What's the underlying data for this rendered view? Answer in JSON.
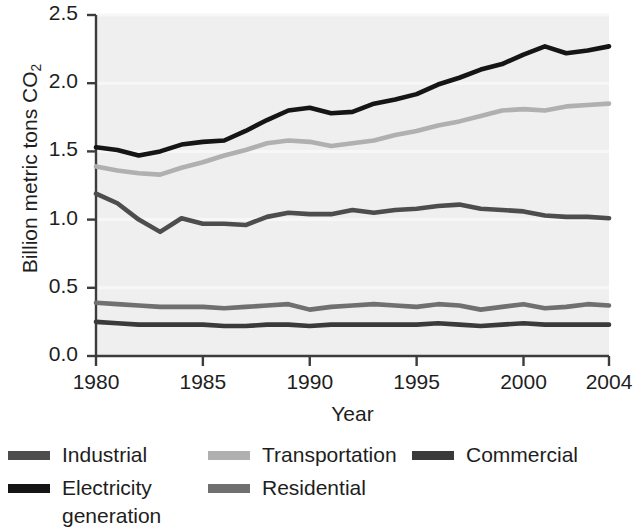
{
  "chart_data": {
    "type": "line",
    "title": "",
    "xlabel": "Year",
    "ylabel": "Billion metric tons CO2",
    "ylabel_base": "Billion metric tons CO",
    "ylabel_sub": "2",
    "xlim": [
      1980,
      2004
    ],
    "ylim": [
      0.0,
      2.5
    ],
    "grid": false,
    "legend_position": "below",
    "x": [
      1980,
      1981,
      1982,
      1983,
      1984,
      1985,
      1986,
      1987,
      1988,
      1989,
      1990,
      1991,
      1992,
      1993,
      1994,
      1995,
      1996,
      1997,
      1998,
      1999,
      2000,
      2001,
      2002,
      2003,
      2004
    ],
    "xticks": [
      1980,
      1985,
      1990,
      1995,
      2000,
      2004
    ],
    "xtick_labels": [
      "1980",
      "1985",
      "1990",
      "1995",
      "2000",
      "2004"
    ],
    "yticks": [
      0.0,
      0.5,
      1.0,
      1.5,
      2.0,
      2.5
    ],
    "ytick_labels": [
      "0.0",
      "0.5",
      "1.0",
      "1.5",
      "2.0",
      "2.5"
    ],
    "series": [
      {
        "name": "Electricity generation",
        "color": "#151515",
        "values": [
          1.53,
          1.51,
          1.47,
          1.5,
          1.55,
          1.57,
          1.58,
          1.65,
          1.73,
          1.8,
          1.82,
          1.78,
          1.79,
          1.85,
          1.88,
          1.92,
          1.99,
          2.04,
          2.1,
          2.14,
          2.21,
          2.27,
          2.22,
          2.24,
          2.27
        ]
      },
      {
        "name": "Transportation",
        "color": "#b0b0b0",
        "values": [
          1.39,
          1.36,
          1.34,
          1.33,
          1.38,
          1.42,
          1.47,
          1.51,
          1.56,
          1.58,
          1.57,
          1.54,
          1.56,
          1.58,
          1.62,
          1.65,
          1.69,
          1.72,
          1.76,
          1.8,
          1.81,
          1.8,
          1.83,
          1.84,
          1.85
        ]
      },
      {
        "name": "Industrial",
        "color": "#4d4d4d",
        "values": [
          1.19,
          1.12,
          1.0,
          0.91,
          1.01,
          0.97,
          0.97,
          0.96,
          1.02,
          1.05,
          1.04,
          1.04,
          1.07,
          1.05,
          1.07,
          1.08,
          1.1,
          1.11,
          1.08,
          1.07,
          1.06,
          1.03,
          1.02,
          1.02,
          1.01
        ]
      },
      {
        "name": "Residential",
        "color": "#707070",
        "values": [
          0.39,
          0.38,
          0.37,
          0.36,
          0.36,
          0.36,
          0.35,
          0.36,
          0.37,
          0.38,
          0.34,
          0.36,
          0.37,
          0.38,
          0.37,
          0.36,
          0.38,
          0.37,
          0.34,
          0.36,
          0.38,
          0.35,
          0.36,
          0.38,
          0.37
        ]
      },
      {
        "name": "Commercial",
        "color": "#3a3a3a",
        "values": [
          0.25,
          0.24,
          0.23,
          0.23,
          0.23,
          0.23,
          0.22,
          0.22,
          0.23,
          0.23,
          0.22,
          0.23,
          0.23,
          0.23,
          0.23,
          0.23,
          0.24,
          0.23,
          0.22,
          0.23,
          0.24,
          0.23,
          0.23,
          0.23,
          0.23
        ]
      }
    ]
  },
  "legend": {
    "items": [
      {
        "label": "Industrial",
        "color": "#4d4d4d"
      },
      {
        "label": "Transportation",
        "color": "#b0b0b0"
      },
      {
        "label": "Commercial",
        "color": "#3a3a3a"
      },
      {
        "label": "Electricity\ngeneration",
        "color": "#151515"
      },
      {
        "label": "Residential",
        "color": "#707070"
      }
    ]
  },
  "axis": {
    "color": "#3c3c3c",
    "plot_background": "#efefef"
  }
}
